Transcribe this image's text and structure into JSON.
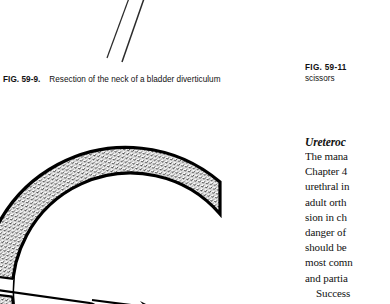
{
  "page": {
    "background_color": "#ffffff",
    "ink_color": "#111111"
  },
  "figures": {
    "top": {
      "name": "instrument-shafts-illustration",
      "description": "two thin diagonal instrument shafts"
    },
    "lower": {
      "name": "bladder-diverticulum-illustration",
      "description": "stippled crescent arc with white band and arrow marker",
      "marker_label": "A"
    }
  },
  "captions": {
    "fig_59_9": {
      "label": "FIG. 59-9.",
      "text": "Resection of the neck of a bladder diverticulum"
    },
    "fig_59_11": {
      "label": "FIG.  59-11",
      "continuation": "scissors"
    }
  },
  "body": {
    "heading": "Ureteroc",
    "lines": [
      {
        "text": "The  mana",
        "indent": false
      },
      {
        "text": "Chapter 4",
        "indent": false
      },
      {
        "text": "urethral  in",
        "indent": false
      },
      {
        "text": "adult  orth",
        "indent": false
      },
      {
        "text": "sion in ch",
        "indent": false
      },
      {
        "text": "danger  of",
        "indent": false
      },
      {
        "text": "should  be",
        "indent": false
      },
      {
        "text": "most comn",
        "indent": false
      },
      {
        "text": "and partia",
        "indent": false
      },
      {
        "text": "Success",
        "indent": true
      }
    ]
  }
}
